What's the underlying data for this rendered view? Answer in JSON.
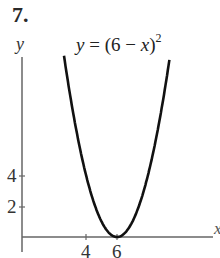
{
  "problem_number": "7.",
  "chart_data": {
    "type": "line",
    "equation": {
      "lhs": "y",
      "rhs_prefix": "(6 − ",
      "rhs_var": "x",
      "rhs_suffix": ")",
      "exponent": "2"
    },
    "xlabel": "x",
    "ylabel": "y",
    "x_ticks": [
      4,
      6
    ],
    "y_ticks": [
      2,
      4
    ],
    "x_tick_labels": [
      "4",
      "6"
    ],
    "y_tick_labels": [
      "2",
      "4"
    ],
    "xlim": [
      0,
      12
    ],
    "ylim": [
      0,
      12
    ],
    "grid": false,
    "series": [
      {
        "name": "y = (6 - x)^2",
        "x": [
          2.6,
          3,
          3.5,
          4,
          4.5,
          5,
          5.5,
          6,
          6.5,
          7,
          7.5,
          8,
          8.5,
          9,
          9.4
        ],
        "y": [
          11.56,
          9,
          6.25,
          4,
          2.25,
          1,
          0.25,
          0,
          0.25,
          1,
          2.25,
          4,
          6.25,
          9,
          11.56
        ]
      }
    ],
    "vertex": {
      "x": 6,
      "y": 0
    },
    "colors": {
      "curve": "#111111",
      "axes": "#555555"
    }
  }
}
